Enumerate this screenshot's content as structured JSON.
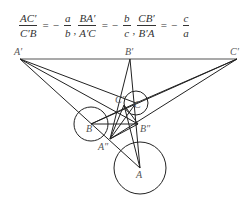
{
  "formula": {
    "terms": [
      {
        "num": "AC′",
        "den": "C′B",
        "rhs_sign": "−",
        "rhs_num": "a",
        "rhs_den": "b"
      },
      {
        "num": "BA′",
        "den": "A′C",
        "rhs_sign": "−",
        "rhs_num": "b",
        "rhs_den": "c"
      },
      {
        "num": "CB′",
        "den": "B′A",
        "rhs_sign": "−",
        "rhs_num": "c",
        "rhs_den": "a"
      }
    ],
    "equals": "=",
    "separator": ","
  },
  "diagram": {
    "points": {
      "A_prime": {
        "label": "A′",
        "x": 20,
        "y": 59
      },
      "B_prime": {
        "label": "B′",
        "x": 130,
        "y": 59
      },
      "C_prime": {
        "label": "C′",
        "x": 237,
        "y": 59
      },
      "A": {
        "label": "A",
        "x": 140,
        "y": 168
      },
      "B": {
        "label": "B",
        "x": 91,
        "y": 124
      },
      "C": {
        "label": "C",
        "x": 136,
        "y": 103
      },
      "A_dprime": {
        "label": "A″",
        "x": 110,
        "y": 139
      },
      "B_dprime": {
        "label": "B″",
        "x": 138,
        "y": 124
      },
      "C_dprime": {
        "label": "C″",
        "x": 124,
        "y": 105
      }
    },
    "circles": [
      {
        "name": "circle-A",
        "cx": 140,
        "cy": 168,
        "r": 26
      },
      {
        "name": "circle-B",
        "cx": 91,
        "cy": 124,
        "r": 17
      },
      {
        "name": "circle-C",
        "cx": 136,
        "cy": 103,
        "r": 12
      }
    ]
  }
}
